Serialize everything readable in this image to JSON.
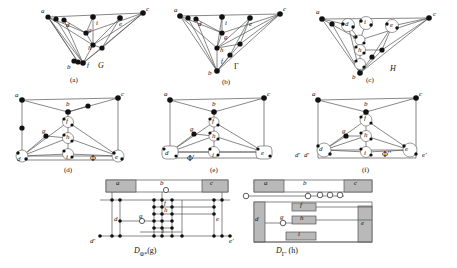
{
  "figure": {
    "background": "#ffffff",
    "ink": "#111111",
    "edge_color": "#555555",
    "node_fill": "#111111",
    "hatch_fill": "#b9b9b9",
    "open_node_fill": "#ffffff"
  },
  "panels": [
    {
      "id": "a",
      "caption": "(a)",
      "graph_name": "G",
      "vertex_labels": [
        "a",
        "c",
        "d",
        "i",
        "e",
        "g",
        "h",
        "b",
        "f"
      ],
      "style": "triangular-graph"
    },
    {
      "id": "b",
      "caption": "(b)",
      "graph_name": "Γ",
      "vertex_labels": [
        "a",
        "c",
        "d",
        "i",
        "e",
        "g",
        "h",
        "b",
        "f"
      ],
      "style": "triangular-graph"
    },
    {
      "id": "c",
      "caption": "(c)",
      "graph_name": "H",
      "vertex_labels": [
        "a",
        "c",
        "d",
        "i",
        "e",
        "g",
        "h",
        "b"
      ],
      "style": "triangular-graph-expanded"
    },
    {
      "id": "d",
      "caption": "(d)",
      "graph_name": "Φ",
      "vertex_labels": [
        "a",
        "b",
        "c",
        "f",
        "g",
        "h",
        "d",
        "i",
        "e"
      ],
      "style": "rectangular-graph"
    },
    {
      "id": "e",
      "caption": "(e)",
      "graph_name": "Φ′",
      "vertex_labels": [
        "a",
        "b",
        "c",
        "f",
        "g",
        "h",
        "d",
        "i",
        "e"
      ],
      "style": "rectangular-graph"
    },
    {
      "id": "f",
      "caption": "(f)",
      "graph_name": "Φ′′",
      "vertex_labels": [
        "a",
        "b",
        "c",
        "f",
        "g",
        "h",
        "d",
        "i",
        "e",
        "d′",
        "e′"
      ],
      "style": "rectangular-graph-expanded"
    },
    {
      "id": "g",
      "caption": "(g)",
      "graph_name": "D",
      "graph_sub": "Φ*",
      "vertex_labels": [
        "a",
        "b",
        "c",
        "f",
        "g",
        "h",
        "d",
        "i",
        "e",
        "d′",
        "e′"
      ],
      "style": "visibility-representation"
    },
    {
      "id": "h",
      "caption": "(h)",
      "graph_name": "D",
      "graph_sub": "Γ′",
      "vertex_labels": [
        "a",
        "b",
        "c",
        "d",
        "g",
        "f",
        "h",
        "i",
        "e"
      ],
      "style": "visibility-representation"
    }
  ],
  "labels": {
    "a": "a",
    "b": "b",
    "c": "c",
    "d": "d",
    "e": "e",
    "f": "f",
    "g": "g",
    "h": "h",
    "i": "i",
    "d_prime": "d′",
    "e_prime": "e′",
    "G": "G",
    "Gamma": "Γ",
    "H": "H",
    "Phi": "Φ",
    "Phi_prime": "Φ′",
    "Phi_dprime": "Φ′′",
    "D": "D",
    "Phi_star": "Φ*",
    "Gamma_prime": "Γ′",
    "cap_a": "(a)",
    "cap_b": "(b)",
    "cap_c": "(c)",
    "cap_d": "(d)",
    "cap_e": "(e)",
    "cap_f": "(f)",
    "cap_g": "(g)",
    "cap_h": "(h)"
  }
}
